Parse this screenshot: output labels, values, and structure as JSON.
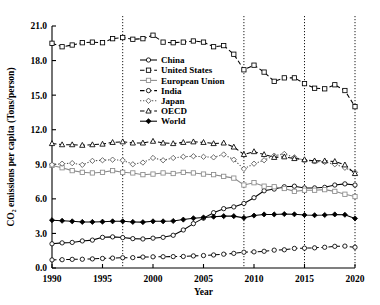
{
  "chart_data": {
    "type": "line",
    "title": "",
    "xlabel": "Year",
    "ylabel": "CO2 emissions per capita (Tons/person)",
    "ylabel_display": "CO₂ emissions per capita (Tons/person)",
    "xlim": [
      1990,
      2020
    ],
    "ylim": [
      0.0,
      21.0
    ],
    "xticks": [
      1990,
      1995,
      2000,
      2005,
      2010,
      2015,
      2020
    ],
    "xtick_labels": [
      "1990",
      "1995",
      "2000",
      "2005",
      "2010",
      "2015",
      "2020"
    ],
    "yticks": [
      0.0,
      3.0,
      6.0,
      9.0,
      12.0,
      15.0,
      18.0,
      21.0
    ],
    "ytick_labels": [
      "0.0",
      "3.0",
      "6.0",
      "9.0",
      "12.0",
      "15.0",
      "18.0",
      "21.0"
    ],
    "grid": false,
    "legend_position": "upper center",
    "vertical_reference_lines": [
      1997,
      2009,
      2015,
      2020
    ],
    "x": [
      1990,
      1991,
      1992,
      1993,
      1994,
      1995,
      1996,
      1997,
      1998,
      1999,
      2000,
      2001,
      2002,
      2003,
      2004,
      2005,
      2006,
      2007,
      2008,
      2009,
      2010,
      2011,
      2012,
      2013,
      2014,
      2015,
      2016,
      2017,
      2018,
      2019,
      2020
    ],
    "series": [
      {
        "name": "China",
        "color": "#000000",
        "line": "solid",
        "marker": "circle-open",
        "values": [
          2.1,
          2.18,
          2.22,
          2.35,
          2.42,
          2.66,
          2.7,
          2.64,
          2.55,
          2.52,
          2.59,
          2.66,
          2.84,
          3.3,
          3.85,
          4.33,
          4.8,
          5.15,
          5.3,
          5.6,
          6.1,
          6.7,
          6.85,
          7.05,
          7.1,
          6.95,
          6.95,
          7.0,
          7.2,
          7.3,
          7.2
        ]
      },
      {
        "name": "United States",
        "color": "#000000",
        "line": "dashed",
        "marker": "square-open",
        "values": [
          19.5,
          19.2,
          19.35,
          19.55,
          19.6,
          19.55,
          19.9,
          20.0,
          19.85,
          19.9,
          20.2,
          19.6,
          19.55,
          19.6,
          19.7,
          19.6,
          19.2,
          19.3,
          18.55,
          17.2,
          17.6,
          17.0,
          16.2,
          16.5,
          16.5,
          16.0,
          15.6,
          15.55,
          15.9,
          15.4,
          14.0
        ]
      },
      {
        "name": "European Union",
        "color": "#8a8a8a",
        "line": "solid",
        "marker": "square-open",
        "values": [
          8.9,
          8.7,
          8.45,
          8.3,
          8.25,
          8.3,
          8.45,
          8.3,
          8.25,
          8.1,
          8.15,
          8.25,
          8.2,
          8.3,
          8.25,
          8.15,
          8.1,
          7.95,
          7.8,
          7.2,
          7.4,
          7.1,
          7.05,
          6.9,
          6.65,
          6.75,
          6.75,
          6.8,
          6.65,
          6.4,
          6.2
        ]
      },
      {
        "name": "India",
        "color": "#000000",
        "line": "dashed",
        "marker": "circle-open",
        "values": [
          0.7,
          0.72,
          0.75,
          0.76,
          0.79,
          0.83,
          0.86,
          0.89,
          0.9,
          0.95,
          0.97,
          0.98,
          0.99,
          1.0,
          1.05,
          1.08,
          1.13,
          1.2,
          1.27,
          1.37,
          1.4,
          1.45,
          1.55,
          1.58,
          1.7,
          1.72,
          1.75,
          1.8,
          1.88,
          1.9,
          1.8
        ]
      },
      {
        "name": "Japan",
        "color": "#555555",
        "line": "dotted",
        "marker": "diamond-open",
        "values": [
          8.95,
          9.05,
          9.1,
          8.95,
          9.3,
          9.35,
          9.4,
          9.35,
          9.0,
          9.15,
          9.55,
          9.35,
          9.55,
          9.65,
          9.7,
          9.65,
          9.6,
          9.85,
          9.4,
          8.6,
          9.05,
          9.35,
          9.75,
          9.9,
          9.6,
          9.35,
          9.25,
          9.2,
          9.0,
          8.7,
          8.3
        ]
      },
      {
        "name": "OECD",
        "color": "#000000",
        "line": "dashed",
        "marker": "triangle-open",
        "values": [
          10.8,
          10.7,
          10.7,
          10.65,
          10.7,
          10.75,
          10.9,
          10.95,
          10.85,
          10.85,
          11.0,
          10.85,
          10.8,
          10.9,
          10.95,
          10.9,
          10.8,
          10.85,
          10.5,
          9.85,
          10.1,
          9.85,
          9.6,
          9.65,
          9.5,
          9.4,
          9.3,
          9.3,
          9.25,
          8.95,
          8.2
        ]
      },
      {
        "name": "World",
        "color": "#000000",
        "line": "solid",
        "marker": "diamond-filled",
        "values": [
          4.15,
          4.1,
          4.05,
          4.0,
          4.0,
          4.02,
          4.05,
          4.05,
          4.0,
          3.98,
          4.05,
          4.05,
          4.08,
          4.2,
          4.32,
          4.38,
          4.45,
          4.5,
          4.5,
          4.35,
          4.55,
          4.65,
          4.65,
          4.68,
          4.66,
          4.6,
          4.58,
          4.6,
          4.65,
          4.62,
          4.3
        ]
      }
    ]
  }
}
